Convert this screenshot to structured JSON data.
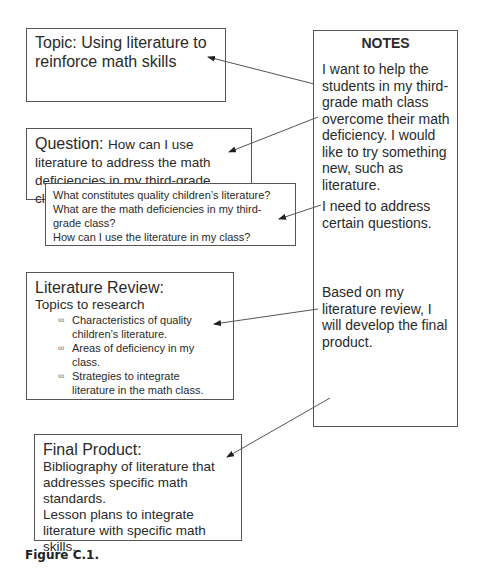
{
  "boxes": {
    "topic": {
      "label": "Topic:",
      "text": "Using literature to reinforce math skills"
    },
    "question": {
      "label": "Question:",
      "text": "How can I use literature to address the math deficiencies in my third-grade class?"
    },
    "sub_questions": [
      "What constitutes quality children’s literature?",
      "What are the math deficiencies in my third-grade class?",
      "How can I use the literature in my class?"
    ],
    "literature_review": {
      "label": "Literature Review:",
      "subtitle": "Topics to research",
      "bullet_glyph": "∞",
      "items": [
        "Characteristics of quality children’s literature.",
        "Areas of deficiency in my class.",
        "Strategies to integrate literature in the math class."
      ]
    },
    "final_product": {
      "label": "Final Product:",
      "lines": [
        "Bibliography of literature that addresses specific math standards.",
        "Lesson plans to integrate literature with specific math skills."
      ]
    }
  },
  "notes": {
    "title": "NOTES",
    "paragraphs": [
      "I want to help the students in my third-grade math class overcome their math deficiency. I would like to try something new, such as literature.",
      "I need to address certain questions.",
      "Based on my literature review, I will develop the final product."
    ]
  },
  "caption": "Figure C.1.",
  "colors": {
    "line": "#555555",
    "text": "#2a2a2a"
  }
}
